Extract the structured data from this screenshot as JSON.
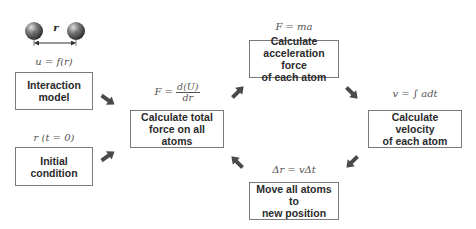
{
  "diagram": {
    "atoms_illustration": {
      "distance_label": "r",
      "sphere_color": "#555555"
    },
    "nodes": [
      {
        "id": "interaction",
        "label": "Interaction\nmodel",
        "formula": "u = f(r)"
      },
      {
        "id": "initial",
        "label": "Initial\ncondition",
        "formula": "r (t = 0)"
      },
      {
        "id": "total_force",
        "label": "Calculate total\nforce on all atoms",
        "formula_lhs": "F =",
        "formula_num": "d(U)",
        "formula_den": "dr"
      },
      {
        "id": "acceleration",
        "label": "Calculate\nacceleration force\nof each atom",
        "formula": "F = ma"
      },
      {
        "id": "velocity",
        "label": "Calculate velocity\nof each atom",
        "formula": "v = ∫ adt"
      },
      {
        "id": "move",
        "label": "Move all atoms to\nnew position",
        "formula": "Δr = vΔt"
      }
    ],
    "edges": [
      {
        "from": "interaction",
        "to": "total_force",
        "direction": "down-right"
      },
      {
        "from": "initial",
        "to": "total_force",
        "direction": "up-right"
      },
      {
        "from": "total_force",
        "to": "acceleration",
        "direction": "up-right"
      },
      {
        "from": "acceleration",
        "to": "velocity",
        "direction": "down-right"
      },
      {
        "from": "velocity",
        "to": "move",
        "direction": "down-left"
      },
      {
        "from": "move",
        "to": "total_force",
        "direction": "up-left"
      }
    ],
    "colors": {
      "box_border": "#7a7a7a",
      "box_text": "#2b2b2b",
      "arrow": "#4a4a4a",
      "formula": "#555555"
    }
  }
}
